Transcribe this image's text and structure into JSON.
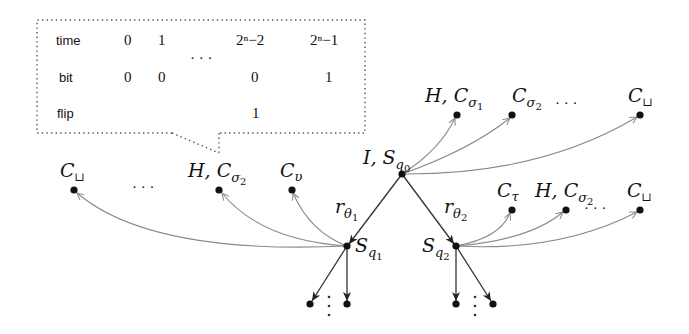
{
  "table": {
    "rows": [
      {
        "label": "time",
        "cells": [
          "0",
          "1",
          "",
          "2ⁿ−2",
          "2ⁿ−1"
        ]
      },
      {
        "label": "bit",
        "cells": [
          "0",
          "0",
          "",
          "0",
          "1"
        ]
      },
      {
        "label": "flip",
        "cells": [
          "",
          "",
          "",
          "1",
          ""
        ]
      }
    ],
    "ellipsis": "· · ·",
    "time_col_exps": {
      "c3": {
        "base": "2",
        "exp": "n",
        "rest": "−2"
      },
      "c4": {
        "base": "2",
        "exp": "n",
        "rest": "−1"
      }
    }
  },
  "nodes": {
    "root": {
      "label_main": "I, S",
      "label_sub": "q",
      "label_subsub": "0"
    },
    "s1": {
      "label_main": "S",
      "label_sub": "q",
      "label_subsub": "1"
    },
    "s2": {
      "label_main": "S",
      "label_sub": "q",
      "label_subsub": "2"
    },
    "top_c_sigma1": {
      "label_main": "H, C",
      "label_sub": "σ",
      "label_subsub": "1"
    },
    "top_c_sigma2": {
      "label_main": "C",
      "label_sub": "σ",
      "label_subsub": "2"
    },
    "top_c_blank": {
      "label_main": "C",
      "label_sub": "⊔"
    },
    "left_c_blank": {
      "label_main": "C",
      "label_sub": "⊔"
    },
    "left_h_c_sigma2": {
      "label_main": "H, C",
      "label_sub": "σ",
      "label_subsub": "2"
    },
    "left_c_upsilon": {
      "label_main": "C",
      "label_sub": "υ"
    },
    "right_c_tau": {
      "label_main": "C",
      "label_sub": "τ"
    },
    "right_h_c_sigma2": {
      "label_main": "H, C",
      "label_sub": "σ",
      "label_subsub": "2"
    },
    "right_c_blank": {
      "label_main": "C",
      "label_sub": "⊔"
    }
  },
  "edges": {
    "r1": {
      "label_main": "r",
      "label_sub": "θ",
      "label_subsub": "1"
    },
    "r2": {
      "label_main": "r",
      "label_sub": "θ",
      "label_subsub": "2"
    }
  },
  "ellipses": {
    "top": "· · ·",
    "left": "· · ·",
    "right": "· · ·"
  }
}
